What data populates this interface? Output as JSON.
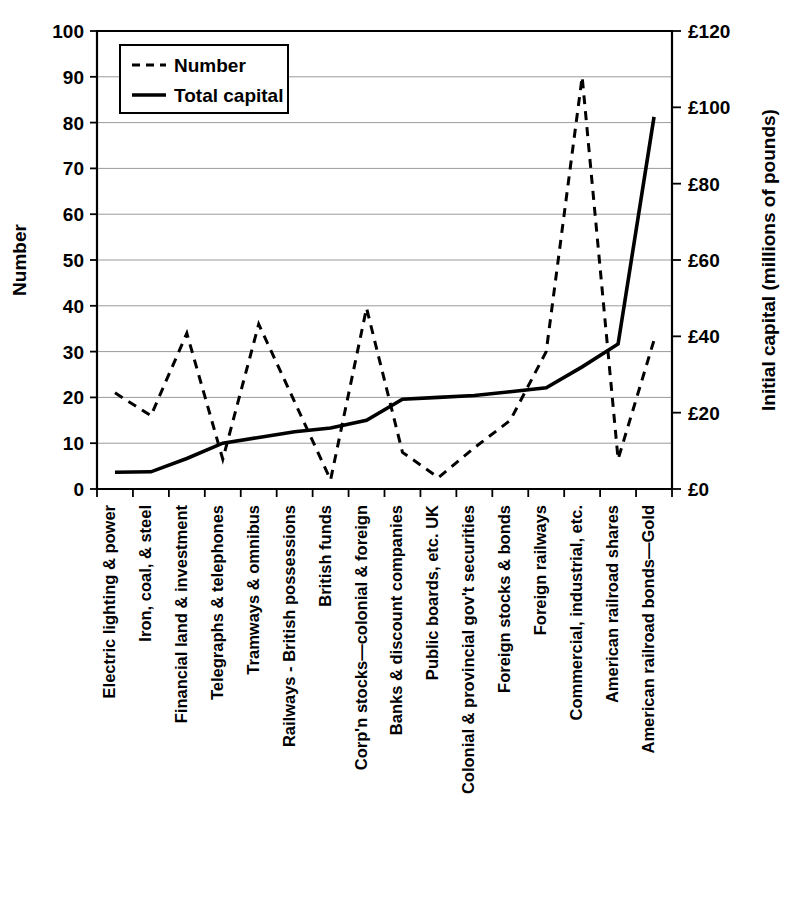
{
  "chart_data": {
    "type": "line",
    "title": "",
    "subtitle": "",
    "xlabel": "",
    "ylabel": "Number",
    "y2label": "Initial capital (millions of pounds)",
    "grid": true,
    "legend_position": "top-left",
    "ylim": [
      0,
      100
    ],
    "y2lim": [
      0,
      120
    ],
    "ytick_labels": [
      "0",
      "10",
      "20",
      "30",
      "40",
      "50",
      "60",
      "70",
      "80",
      "90",
      "100"
    ],
    "ytick_values": [
      0,
      10,
      20,
      30,
      40,
      50,
      60,
      70,
      80,
      90,
      100
    ],
    "y2tick_labels": [
      "£0",
      "£20",
      "£40",
      "£60",
      "£80",
      "£100",
      "£120"
    ],
    "y2tick_values": [
      0,
      20,
      40,
      60,
      80,
      100,
      120
    ],
    "categories": [
      "Electric lighting & power",
      "Iron, coal, & steel",
      "Financial land & investment",
      "Telegraphs & telephones",
      "Tramways & omnibus",
      "Railways - British possessions",
      "British funds",
      "Corp'n stocks—colonial & foreign",
      "Banks & discount companies",
      "Public boards, etc. UK",
      "Colonial & provincial gov't securities",
      "Foreign stocks & bonds",
      "Foreign railways",
      "Commercial, industrial, etc.",
      "American railroad shares",
      "American railroad bonds—Gold"
    ],
    "series": [
      {
        "name": "Number",
        "style": "dashed",
        "axis": "left",
        "values": [
          21,
          16,
          34,
          6.5,
          36,
          19,
          2,
          39.5,
          8,
          2.5,
          9,
          15,
          30,
          90,
          6.5,
          32.5
        ]
      },
      {
        "name": "Total capital",
        "style": "solid",
        "axis": "right",
        "values": [
          4.4,
          4.5,
          8,
          12,
          13.5,
          15,
          16,
          18,
          23.5,
          24,
          24.5,
          25.5,
          26.5,
          32,
          38,
          97.5
        ]
      }
    ],
    "legend": [
      {
        "label": "Number",
        "style": "dashed"
      },
      {
        "label": "Total capital",
        "style": "solid"
      }
    ]
  }
}
